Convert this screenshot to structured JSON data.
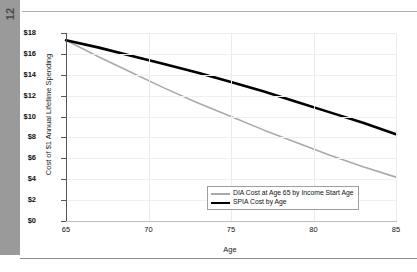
{
  "page": {
    "page_number": "12"
  },
  "chart_data": {
    "type": "line",
    "title": "",
    "xlabel": "Age",
    "ylabel": "Cost of $1 Annual Lifetime Spending",
    "xlim": [
      65,
      85
    ],
    "ylim": [
      0,
      18
    ],
    "xticks": [
      65,
      70,
      75,
      80,
      85
    ],
    "xtick_labels": [
      "65",
      "70",
      "75",
      "80",
      "85"
    ],
    "yticks": [
      0,
      2,
      4,
      6,
      8,
      10,
      12,
      14,
      16,
      18
    ],
    "ytick_labels": [
      "$0",
      "$2",
      "$4",
      "$6",
      "$8",
      "$10",
      "$12",
      "$14",
      "$16",
      "$18"
    ],
    "grid": true,
    "legend_position": "lower right",
    "x": [
      65,
      67,
      69,
      71,
      73,
      75,
      77,
      79,
      81,
      83,
      85
    ],
    "series": [
      {
        "name": "DIA Cost at Age 65 by Income Start Age",
        "color": "#a9a9a9",
        "width": 1.6,
        "values": [
          17.3,
          15.7,
          14.2,
          12.7,
          11.3,
          10.0,
          8.7,
          7.5,
          6.3,
          5.2,
          4.2
        ]
      },
      {
        "name": "SPIA Cost by Age",
        "color": "#000000",
        "width": 2.6,
        "values": [
          17.3,
          16.6,
          15.8,
          15.0,
          14.2,
          13.3,
          12.4,
          11.4,
          10.4,
          9.4,
          8.3
        ]
      }
    ]
  }
}
